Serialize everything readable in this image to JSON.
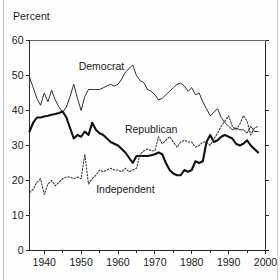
{
  "figure": {
    "axis_title": "Percent",
    "background_color": "#fefefe",
    "ink_color": "#1a1a1a"
  },
  "labels": {
    "democrat": "Democrat",
    "republican": "Republican",
    "independent": "Independent"
  },
  "chart_data": {
    "type": "line",
    "title": "",
    "subtitle": "",
    "xlabel": "",
    "ylabel": "Percent",
    "xlim": [
      1936,
      2000
    ],
    "ylim": [
      0,
      60
    ],
    "grid": false,
    "legend": "inline-annotations",
    "y_ticks": [
      0,
      10,
      20,
      30,
      40,
      50,
      60
    ],
    "y_tick_labels": [
      "0",
      "10",
      "20",
      "30",
      "40",
      "50",
      "60"
    ],
    "x_ticks": [
      1940,
      1950,
      1960,
      1970,
      1980,
      1990,
      2000
    ],
    "x_tick_labels": [
      "1940",
      "1950",
      "1960",
      "1970",
      "1980",
      "1990",
      "2000"
    ],
    "x_minor_ticks": [
      1945,
      1955,
      1965,
      1975,
      1985,
      1995
    ],
    "annotations": [
      {
        "text": "Democrat",
        "x": 1955.5,
        "y": 51.5
      },
      {
        "text": "Republican",
        "x": 1969.0,
        "y": 33.5
      },
      {
        "text": "Independent",
        "x": 1962.0,
        "y": 16.5
      }
    ],
    "series": [
      {
        "name": "Democrat",
        "style": "thin-solid",
        "color": "#242424",
        "x": [
          1936,
          1937,
          1938,
          1939,
          1940,
          1941,
          1942,
          1943,
          1944,
          1945,
          1946,
          1947,
          1948,
          1949,
          1950,
          1951,
          1952,
          1953,
          1954,
          1955,
          1956,
          1957,
          1958,
          1959,
          1960,
          1961,
          1962,
          1963,
          1964,
          1965,
          1966,
          1967,
          1968,
          1969,
          1970,
          1971,
          1972,
          1973,
          1974,
          1975,
          1976,
          1977,
          1978,
          1979,
          1980,
          1981,
          1982,
          1983,
          1984,
          1985,
          1986,
          1987,
          1988,
          1989,
          1990,
          1991,
          1992,
          1993,
          1994,
          1995,
          1996,
          1997,
          1998
        ],
        "y": [
          49.5,
          46.5,
          43.5,
          41.5,
          45.0,
          42.5,
          45.8,
          43.0,
          41.0,
          39.5,
          41.0,
          44.0,
          47.5,
          43.5,
          40.0,
          44.0,
          46.0,
          46.0,
          46.0,
          46.0,
          46.5,
          47.0,
          47.5,
          47.0,
          47.5,
          49.0,
          51.0,
          52.0,
          53.0,
          50.0,
          48.5,
          48.0,
          46.0,
          45.5,
          44.5,
          43.0,
          43.5,
          44.5,
          45.5,
          46.5,
          47.5,
          47.8,
          47.0,
          45.5,
          46.5,
          44.5,
          45.0,
          42.5,
          40.5,
          38.5,
          39.5,
          40.5,
          38.0,
          36.5,
          35.5,
          34.5,
          35.0,
          34.5,
          34.5,
          33.5,
          35.5,
          34.0,
          34.0
        ]
      },
      {
        "name": "Republican",
        "style": "thick-solid",
        "color": "#111111",
        "x": [
          1936,
          1937,
          1938,
          1939,
          1940,
          1941,
          1942,
          1943,
          1944,
          1945,
          1946,
          1947,
          1948,
          1949,
          1950,
          1951,
          1952,
          1953,
          1954,
          1955,
          1956,
          1957,
          1958,
          1959,
          1960,
          1961,
          1962,
          1963,
          1964,
          1965,
          1966,
          1967,
          1968,
          1969,
          1970,
          1971,
          1972,
          1973,
          1974,
          1975,
          1976,
          1977,
          1978,
          1979,
          1980,
          1981,
          1982,
          1983,
          1984,
          1985,
          1986,
          1987,
          1988,
          1989,
          1990,
          1991,
          1992,
          1993,
          1994,
          1995,
          1996,
          1997,
          1998
        ],
        "y": [
          34.0,
          36.5,
          38.0,
          38.0,
          38.3,
          38.5,
          38.8,
          39.0,
          39.3,
          39.7,
          38.0,
          35.0,
          32.0,
          33.0,
          32.5,
          34.0,
          33.0,
          36.5,
          34.5,
          33.5,
          33.0,
          32.0,
          31.0,
          30.5,
          30.0,
          29.0,
          28.0,
          26.5,
          25.0,
          27.0,
          27.0,
          27.0,
          27.0,
          27.2,
          27.5,
          28.0,
          27.5,
          25.0,
          23.0,
          22.0,
          21.5,
          21.5,
          23.0,
          22.5,
          23.0,
          25.5,
          25.0,
          25.5,
          31.0,
          33.0,
          31.0,
          31.5,
          32.5,
          33.0,
          32.5,
          32.0,
          30.5,
          30.0,
          30.5,
          31.5,
          30.0,
          29.0,
          28.0
        ]
      },
      {
        "name": "Independent",
        "style": "dotted",
        "color": "#333333",
        "x": [
          1936,
          1937,
          1938,
          1939,
          1940,
          1941,
          1942,
          1943,
          1944,
          1945,
          1946,
          1947,
          1948,
          1949,
          1950,
          1951,
          1952,
          1953,
          1954,
          1955,
          1956,
          1957,
          1958,
          1959,
          1960,
          1961,
          1962,
          1963,
          1964,
          1965,
          1966,
          1967,
          1968,
          1969,
          1970,
          1971,
          1972,
          1973,
          1974,
          1975,
          1976,
          1977,
          1978,
          1979,
          1980,
          1981,
          1982,
          1983,
          1984,
          1985,
          1986,
          1987,
          1988,
          1989,
          1990,
          1991,
          1992,
          1993,
          1994,
          1995,
          1996,
          1997,
          1998
        ],
        "y": [
          16.5,
          17.5,
          19.5,
          20.5,
          16.0,
          19.0,
          20.0,
          18.5,
          19.5,
          20.5,
          21.0,
          21.0,
          20.5,
          21.0,
          20.5,
          27.5,
          19.0,
          20.5,
          21.5,
          23.0,
          22.5,
          23.0,
          23.5,
          23.0,
          23.0,
          22.5,
          23.5,
          22.5,
          23.0,
          23.5,
          27.5,
          28.5,
          29.0,
          28.5,
          28.5,
          32.5,
          30.5,
          31.5,
          32.5,
          31.0,
          29.5,
          31.0,
          31.5,
          31.0,
          31.0,
          29.5,
          30.0,
          31.0,
          31.0,
          30.0,
          32.0,
          33.5,
          35.5,
          37.0,
          38.5,
          35.5,
          34.5,
          36.0,
          38.5,
          37.0,
          33.0,
          35.0,
          35.5
        ]
      }
    ]
  }
}
